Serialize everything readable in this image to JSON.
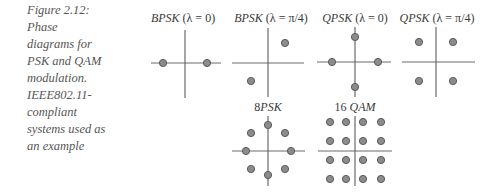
{
  "caption": {
    "lines": [
      "Figure 2.12:",
      "Phase",
      "diagrams for",
      "PSK and QAM",
      "modulation.",
      "IEEE802.11-",
      "compliant",
      "systems used as",
      "an example"
    ]
  },
  "diagrams": [
    {
      "id": "bpsk-0",
      "title_name": "BPSK",
      "title_param": " (λ = 0)",
      "points": 2
    },
    {
      "id": "bpsk-pi4",
      "title_name": "BPSK",
      "title_param": " (λ = π/4)",
      "points": 2
    },
    {
      "id": "qpsk-0",
      "title_name": "QPSK",
      "title_param": " (λ = 0)",
      "points": 4
    },
    {
      "id": "qpsk-pi4",
      "title_name": "QPSK",
      "title_param": " (λ = π/4)",
      "points": 4
    },
    {
      "id": "8psk",
      "title_prefix": "8",
      "title_name": "PSK",
      "points": 8
    },
    {
      "id": "16qam",
      "title_prefix": "16 ",
      "title_name": "QAM",
      "points": 16
    }
  ],
  "colors": {
    "axis": "#6a6a6a",
    "point_fill": "#8c8c8c",
    "point_stroke": "#5a5a5a",
    "caption_text": "#555555"
  }
}
